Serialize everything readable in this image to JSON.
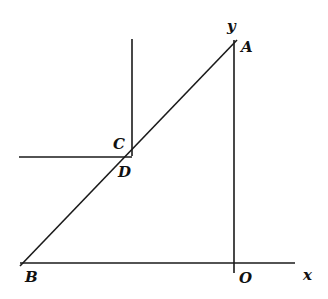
{
  "diagram": {
    "type": "geometry-figure",
    "colors": {
      "stroke": "#1a1a1a",
      "background": "#ffffff",
      "text": "#111111"
    },
    "labels": {
      "A": "A",
      "B": "B",
      "C": "C",
      "D": "D",
      "O": "O",
      "x": "x",
      "y": "y"
    },
    "points": {
      "A": [
        233,
        45
      ],
      "B": [
        22,
        263
      ],
      "D": [
        132,
        156
      ],
      "O": [
        234,
        263
      ]
    },
    "segments": [
      {
        "name": "AB",
        "from": "A",
        "to": "B"
      },
      {
        "name": "y-axis",
        "from": [
          234,
          40
        ],
        "to": [
          234,
          273
        ]
      },
      {
        "name": "x-axis",
        "from": [
          20,
          263
        ],
        "to": [
          295,
          263
        ]
      },
      {
        "name": "vertical-at-C",
        "from": [
          132,
          39
        ],
        "to": [
          132,
          156
        ]
      },
      {
        "name": "horizontal-at-D",
        "from": [
          19,
          157
        ],
        "to": [
          132,
          157
        ]
      }
    ]
  }
}
